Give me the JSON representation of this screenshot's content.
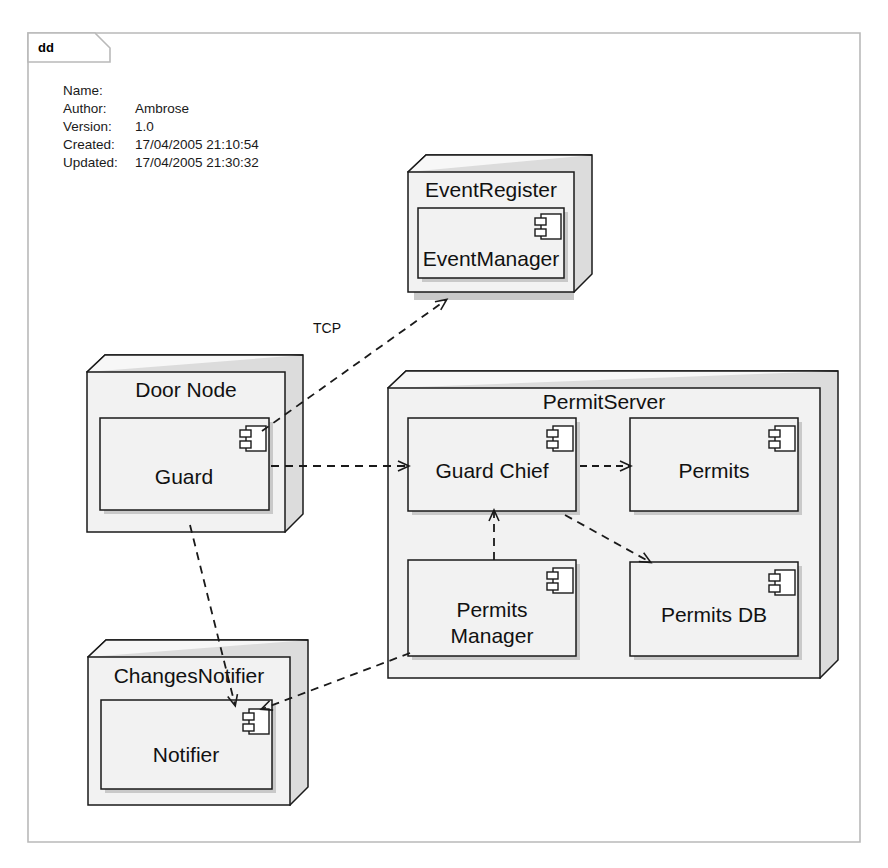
{
  "frame": {
    "tab_label": "dd",
    "kind": "deployment-diagram-frame"
  },
  "metadata": {
    "rows": [
      {
        "label": "Name:",
        "value": ""
      },
      {
        "label": "Author:",
        "value": "Ambrose"
      },
      {
        "label": "Version:",
        "value": "1.0"
      },
      {
        "label": "Created:",
        "value": "17/04/2005 21:10:54"
      },
      {
        "label": "Updated:",
        "value": "17/04/2005 21:30:32"
      }
    ]
  },
  "nodes": [
    {
      "id": "eventregister",
      "label": "EventRegister",
      "components": [
        {
          "id": "eventmanager",
          "label": "EventManager"
        }
      ]
    },
    {
      "id": "doornode",
      "label": "Door Node",
      "components": [
        {
          "id": "guard",
          "label": "Guard"
        }
      ]
    },
    {
      "id": "changesnotifier",
      "label": "ChangesNotifier",
      "components": [
        {
          "id": "notifier",
          "label": "Notifier"
        }
      ]
    },
    {
      "id": "permitserver",
      "label": "PermitServer",
      "components": [
        {
          "id": "guardchief",
          "label": "Guard Chief"
        },
        {
          "id": "permits",
          "label": "Permits"
        },
        {
          "id": "permitsmanager",
          "label": "Permits",
          "label2": "Manager"
        },
        {
          "id": "permitsdb",
          "label": "Permits DB"
        }
      ]
    }
  ],
  "connections": [
    {
      "id": "guard-to-eventregister",
      "from": "guard",
      "to": "eventregister",
      "label": "TCP",
      "style": "dashed",
      "arrow": "open"
    },
    {
      "id": "guard-to-guardchief",
      "from": "guard",
      "to": "guardchief",
      "label": "",
      "style": "dashed",
      "arrow": "open"
    },
    {
      "id": "guardchief-to-permits",
      "from": "guardchief",
      "to": "permits",
      "label": "",
      "style": "dashed",
      "arrow": "open"
    },
    {
      "id": "guardchief-to-permitsdb",
      "from": "guardchief",
      "to": "permitsdb",
      "label": "",
      "style": "dashed",
      "arrow": "open"
    },
    {
      "id": "permitsmanager-to-guardchief",
      "from": "permitsmanager",
      "to": "guardchief",
      "label": "",
      "style": "dashed",
      "arrow": "open"
    },
    {
      "id": "guard-to-notifier",
      "from": "guard",
      "to": "notifier",
      "label": "",
      "style": "dashed",
      "arrow": "open"
    },
    {
      "id": "permitsmanager-to-notifier",
      "from": "permitsmanager",
      "to": "notifier",
      "label": "",
      "style": "dashed",
      "arrow": "open"
    }
  ],
  "colors": {
    "background": "#ffffff",
    "frame_border": "#b9b9b9",
    "node_fill": "#f2f2f2",
    "node_top_fill": "#f7f7f7",
    "node_side_fill": "#dcdcdc",
    "component_fill": "#f2f2f2",
    "stroke": "#1a1a1a",
    "shadow": "#c9c9c9",
    "text": "#111111"
  }
}
